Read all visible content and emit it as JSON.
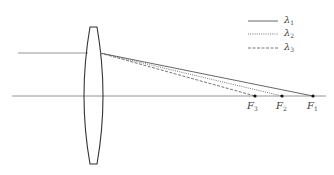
{
  "diagram": {
    "colors": {
      "line": "#555555",
      "axis": "#888888",
      "lens": "#333333",
      "background": "#ffffff"
    },
    "legend": [
      {
        "symbol": "λ",
        "sub": "1",
        "style": "solid"
      },
      {
        "symbol": "λ",
        "sub": "2",
        "style": "dotted"
      },
      {
        "symbol": "λ",
        "sub": "3",
        "style": "dashed"
      }
    ],
    "focal_points": [
      {
        "symbol": "F",
        "sub": "3",
        "x": 255
      },
      {
        "symbol": "F",
        "sub": "2",
        "x": 282
      },
      {
        "symbol": "F",
        "sub": "1",
        "x": 313
      }
    ]
  }
}
